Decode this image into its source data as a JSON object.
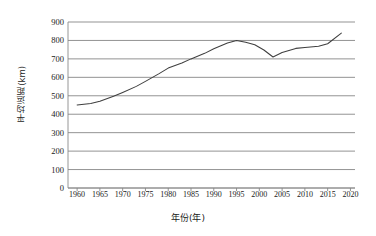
{
  "chart_data": {
    "type": "line",
    "title": "",
    "xlabel": "年份(年)",
    "ylabel": "平均运距(km)",
    "xlim": [
      1958,
      2021
    ],
    "ylim": [
      0,
      900
    ],
    "ytick_step": 100,
    "xtick_step": 5,
    "grid": "horizontal",
    "legend": "none",
    "line_color": "#3f3f3f",
    "axis_color": "#808080",
    "background": "#ffffff",
    "ytick_labels": [
      "900",
      "800",
      "700",
      "600",
      "500",
      "400",
      "300",
      "200",
      "100",
      "0"
    ],
    "ytick_values": [
      900,
      800,
      700,
      600,
      500,
      400,
      300,
      200,
      100,
      0
    ],
    "xtick_labels": [
      "1960",
      "1965",
      "1970",
      "1975",
      "1980",
      "1985",
      "1990",
      "1995",
      "2000",
      "2005",
      "2010",
      "2015",
      "2020"
    ],
    "xtick_values": [
      1960,
      1965,
      1970,
      1975,
      1980,
      1985,
      1990,
      1995,
      2000,
      2005,
      2010,
      2015,
      2020
    ],
    "series": [
      {
        "name": "平均运距",
        "x": [
          1960,
          1963,
          1965,
          1968,
          1970,
          1973,
          1975,
          1978,
          1980,
          1983,
          1985,
          1988,
          1990,
          1993,
          1995,
          1997,
          1999,
          2001,
          2003,
          2005,
          2008,
          2010,
          2013,
          2015,
          2018
        ],
        "values": [
          450,
          458,
          470,
          497,
          518,
          551,
          578,
          620,
          650,
          678,
          700,
          730,
          755,
          786,
          800,
          790,
          777,
          748,
          710,
          735,
          757,
          762,
          768,
          782,
          840
        ]
      }
    ]
  }
}
